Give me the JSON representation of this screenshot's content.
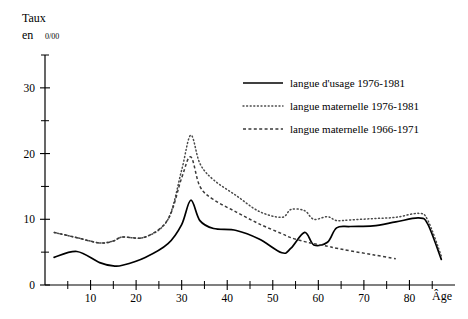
{
  "chart_data": {
    "type": "line",
    "title": "",
    "ylabel_line1": "Taux",
    "ylabel_line2_prefix": "en",
    "ylabel_line2_unit": "0/00",
    "xlabel": "Âge",
    "xlim": [
      0,
      90
    ],
    "ylim": [
      0,
      35
    ],
    "grid": false,
    "legend_position": "upper-right",
    "x_ticks_major": [
      10,
      20,
      30,
      40,
      50,
      60,
      70,
      80
    ],
    "x_ticks_minor": [
      5,
      15,
      25,
      35,
      45,
      55,
      65,
      75,
      85
    ],
    "x_tick_labels": [
      "10",
      "20",
      "30",
      "40",
      "50",
      "60",
      "70",
      "80"
    ],
    "y_ticks_major": [
      0,
      10,
      20,
      30
    ],
    "y_ticks_minor": [
      5,
      15,
      25,
      35
    ],
    "y_tick_labels": [
      "0",
      "10",
      "20",
      "30"
    ],
    "series": [
      {
        "name": "langue d'usage 1976-1981",
        "style": "solid",
        "x": [
          2,
          7,
          12,
          15,
          17,
          22,
          27,
          30,
          32,
          34,
          37,
          42,
          47,
          52,
          54,
          57,
          59,
          62,
          64,
          67,
          72,
          77,
          82,
          84,
          87
        ],
        "values": [
          4.2,
          5.1,
          3.4,
          2.9,
          3.0,
          4.2,
          6.3,
          9.2,
          12.9,
          9.8,
          8.6,
          8.3,
          7.0,
          4.9,
          5.6,
          8.0,
          6.1,
          6.5,
          8.7,
          8.9,
          9.0,
          9.6,
          10.2,
          9.3,
          3.9
        ]
      },
      {
        "name": "langue maternelle 1976-1981",
        "style": "dotted",
        "x": [
          2,
          7,
          12,
          15,
          17,
          22,
          27,
          30,
          32,
          34,
          37,
          42,
          47,
          52,
          54,
          57,
          59,
          62,
          64,
          67,
          72,
          77,
          82,
          84,
          87
        ],
        "values": [
          8.0,
          7.2,
          6.4,
          6.7,
          7.3,
          7.3,
          10.0,
          17.5,
          22.8,
          18.5,
          16.0,
          13.6,
          11.2,
          10.3,
          11.5,
          11.3,
          10.0,
          10.4,
          9.8,
          9.9,
          10.1,
          10.3,
          10.9,
          9.9,
          4.4
        ]
      },
      {
        "name": "langue maternelle 1966-1971",
        "style": "dashed",
        "x": [
          2,
          7,
          12,
          15,
          17,
          22,
          27,
          30,
          32,
          34,
          37,
          42,
          47,
          52,
          54,
          57,
          59,
          62,
          64,
          67,
          72,
          77
        ],
        "values": [
          8.0,
          7.2,
          6.4,
          6.7,
          7.3,
          7.3,
          10.0,
          16.3,
          19.5,
          15.0,
          13.0,
          11.1,
          9.3,
          7.8,
          7.2,
          6.6,
          6.3,
          5.9,
          5.6,
          5.2,
          4.6,
          4.0
        ]
      }
    ]
  },
  "legend": {
    "items": [
      {
        "label": "langue d'usage 1976-1981",
        "style": "solid"
      },
      {
        "label": "langue maternelle 1976-1981",
        "style": "dotted"
      },
      {
        "label": "langue maternelle 1966-1971",
        "style": "dashed"
      }
    ]
  },
  "colors": {
    "axis": "#000000",
    "series_solid": "#000000",
    "series_dotted": "#4a4a4a",
    "series_dashed": "#3a3a3a",
    "background": "#ffffff"
  }
}
